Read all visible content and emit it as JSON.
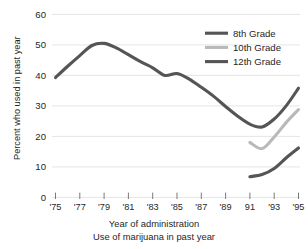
{
  "figure": {
    "clipped_top_fragment": "",
    "caption_axis": "Year of administration",
    "caption_figure": "Use of marijuana in past year"
  },
  "legend": {
    "position": "top-right",
    "entries": [
      {
        "label": "8th Grade",
        "color": "#555555"
      },
      {
        "label": "10th Grade",
        "color": "#b9b9b9"
      },
      {
        "label": "12th Grade",
        "color": "#555555"
      }
    ]
  },
  "axes": {
    "y": {
      "label": "Percent who used in past year",
      "ticks": [
        "0",
        "10",
        "20",
        "30",
        "40",
        "50",
        "60"
      ],
      "min": 0,
      "max": 60
    },
    "x": {
      "label": "Year of administration",
      "ticks": [
        "'75",
        "'77",
        "'79",
        "'81",
        "'83",
        "'85",
        "'87",
        "'89",
        "91",
        "'93",
        "'95"
      ],
      "min": 1975,
      "max": 1995
    }
  },
  "chart_data": {
    "type": "line",
    "title": "Use of marijuana in past year",
    "xlabel": "Year of administration",
    "ylabel": "Percent who used in past year",
    "xlim": [
      1975,
      1995
    ],
    "ylim": [
      0,
      60
    ],
    "grid": true,
    "grid_axis": "y",
    "legend_position": "top-right",
    "xtick_labels": [
      "'75",
      "'77",
      "'79",
      "'81",
      "'83",
      "'85",
      "'87",
      "'89",
      "91",
      "'93",
      "'95"
    ],
    "xtick_values": [
      1975,
      1977,
      1979,
      1981,
      1983,
      1985,
      1987,
      1989,
      1991,
      1993,
      1995
    ],
    "ytick_values": [
      0,
      10,
      20,
      30,
      40,
      50,
      60
    ],
    "series": [
      {
        "name": "12th Grade",
        "color": "#555555",
        "x": [
          1975,
          1976,
          1977,
          1978,
          1979,
          1980,
          1981,
          1982,
          1983,
          1984,
          1985,
          1986,
          1987,
          1988,
          1989,
          1990,
          1991,
          1992,
          1993,
          1994,
          1995
        ],
        "values": [
          39.3,
          43.0,
          46.5,
          49.8,
          50.5,
          49.0,
          46.8,
          44.5,
          42.5,
          40.0,
          40.6,
          38.8,
          36.1,
          33.2,
          29.8,
          26.6,
          24.0,
          23.1,
          25.7,
          30.1,
          35.8
        ]
      },
      {
        "name": "10th Grade",
        "color": "#b9b9b9",
        "x": [
          1991,
          1992,
          1993,
          1994,
          1995
        ],
        "values": [
          18.0,
          16.0,
          19.8,
          24.6,
          28.8
        ]
      },
      {
        "name": "8th Grade",
        "color": "#555555",
        "x": [
          1991,
          1992,
          1993,
          1994,
          1995
        ],
        "values": [
          6.8,
          7.5,
          9.5,
          13.0,
          16.2
        ]
      }
    ]
  }
}
